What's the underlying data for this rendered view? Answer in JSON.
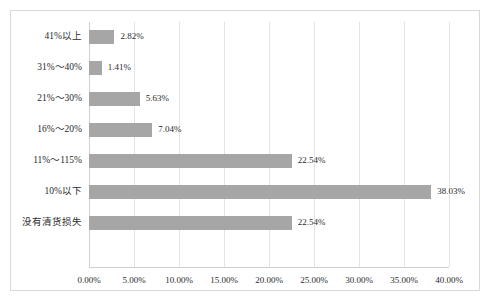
{
  "chart_data": {
    "type": "bar",
    "orientation": "horizontal",
    "title": "",
    "subtitle": "",
    "xlabel": "",
    "ylabel": "",
    "xlim": [
      0,
      40
    ],
    "categories": [
      "41%以上",
      "31%～40%",
      "21%～30%",
      "16%～20%",
      "11%～115%",
      "10%以下",
      "没有清货损失"
    ],
    "values": [
      2.82,
      1.41,
      5.63,
      7.04,
      22.54,
      38.03,
      22.54
    ],
    "value_labels": [
      "2.82%",
      "1.41%",
      "5.63%",
      "7.04%",
      "22.54%",
      "38.03%",
      "22.54%"
    ],
    "x_ticks": [
      0,
      5,
      10,
      15,
      20,
      25,
      30,
      35,
      40
    ],
    "x_tick_labels": [
      "0.00%",
      "5.00%",
      "10.00%",
      "15.00%",
      "20.00%",
      "25.00%",
      "30.00%",
      "35.00%",
      "40.00%"
    ],
    "grid": {
      "vertical": true,
      "horizontal": false
    },
    "legend": {
      "visible": false,
      "position": "none"
    },
    "colors": {
      "bar": "#a6a6a6",
      "gridline": "#e3e3e3",
      "axis": "#d0d0d0",
      "frame_border": "#d9d9d9",
      "text": "#2b2b2b",
      "background": "#ffffff"
    }
  }
}
